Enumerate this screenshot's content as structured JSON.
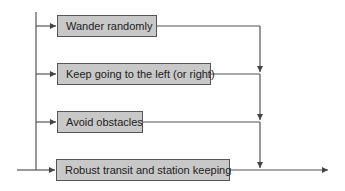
{
  "diagram": {
    "type": "subsumption-architecture",
    "colors": {
      "box_fill": "#c8c8c8",
      "box_border": "#555555",
      "line": "#555555",
      "text": "#222222"
    },
    "behaviors": [
      {
        "label": "Wander randomly"
      },
      {
        "label": "Keep going to the left (or right)"
      },
      {
        "label": "Avoid obstacles"
      },
      {
        "label": "Robust transit and station keeping"
      }
    ]
  }
}
